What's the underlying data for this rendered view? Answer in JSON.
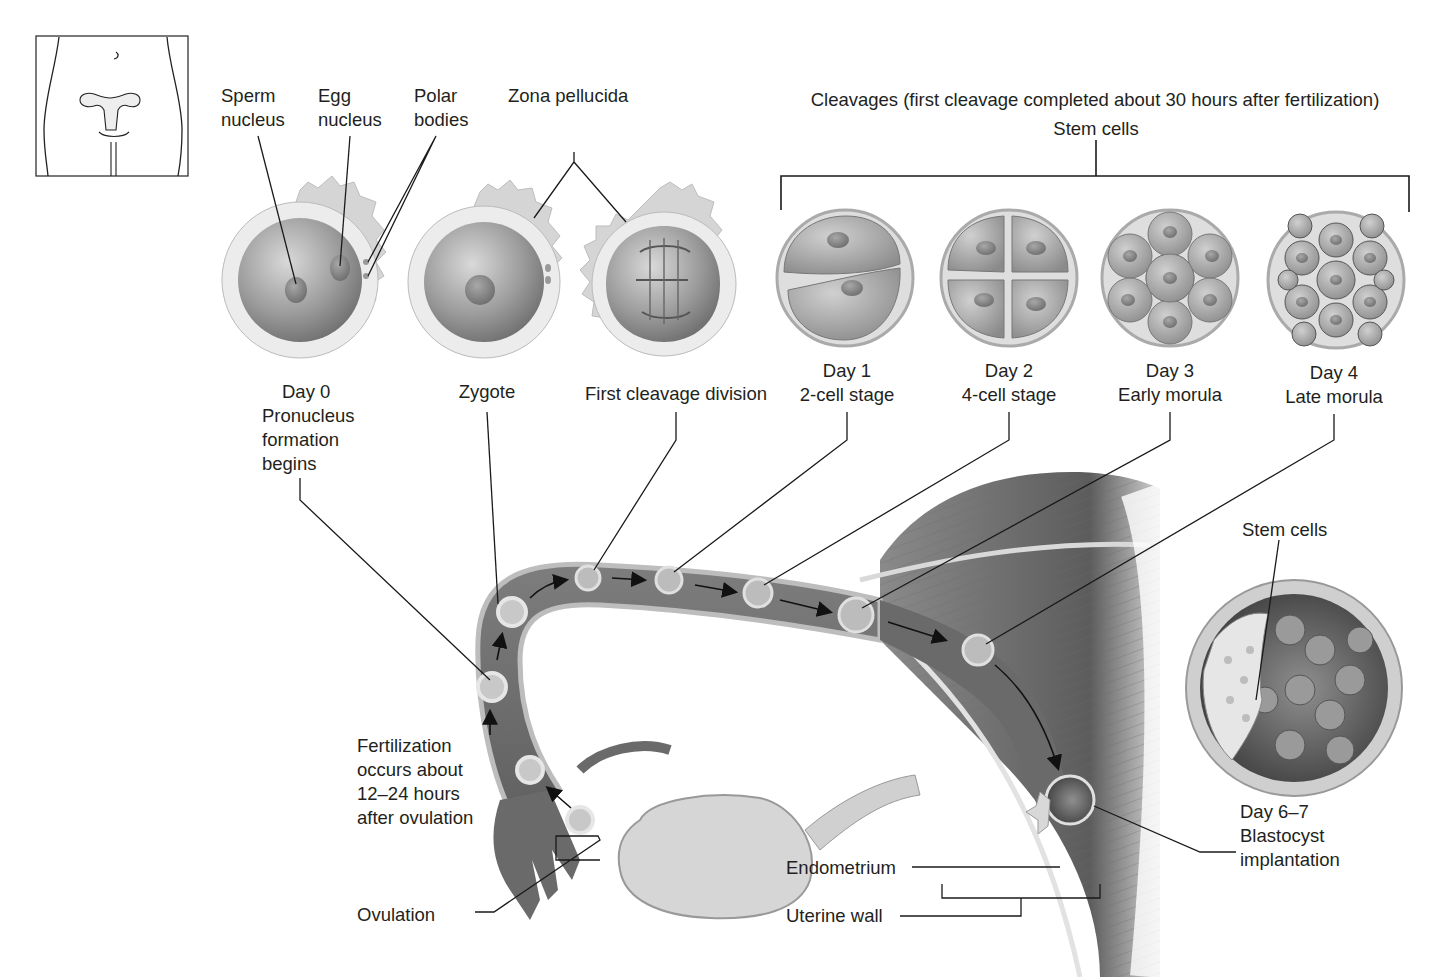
{
  "figure": {
    "type": "anatomical-diagram"
  },
  "locator_inset": {
    "name": "female-torso-with-uterus-locator"
  },
  "top_labels": {
    "sperm_nucleus": [
      "Sperm",
      "nucleus"
    ],
    "egg_nucleus": [
      "Egg",
      "nucleus"
    ],
    "polar_bodies": [
      "Polar",
      "bodies"
    ],
    "zona_pellucida": "Zona pellucida",
    "cleavages_title": "Cleavages (first cleavage completed about 30 hours after fertilization)",
    "stem_cells_top": "Stem cells"
  },
  "stages": [
    {
      "id": "day0",
      "lines": [
        "Day 0",
        "Pronucleus",
        "formation",
        "begins"
      ]
    },
    {
      "id": "zygote",
      "lines": [
        "Zygote"
      ]
    },
    {
      "id": "first-cleavage",
      "lines": [
        "First cleavage division"
      ]
    },
    {
      "id": "day1",
      "lines": [
        "Day 1",
        "2-cell stage"
      ]
    },
    {
      "id": "day2",
      "lines": [
        "Day 2",
        "4-cell stage"
      ]
    },
    {
      "id": "day3",
      "lines": [
        "Day 3",
        "Early morula"
      ]
    },
    {
      "id": "day4",
      "lines": [
        "Day 4",
        "Late morula"
      ]
    }
  ],
  "bottom_labels": {
    "fertilization": [
      "Fertilization",
      "occurs about",
      "12–24 hours",
      "after ovulation"
    ],
    "ovulation": "Ovulation",
    "endometrium": "Endometrium",
    "uterine_wall": "Uterine wall",
    "stem_cells_blastocyst": "Stem cells",
    "blastocyst": [
      "Day 6–7",
      "Blastocyst",
      "implantation"
    ]
  },
  "colors": {
    "background": "#ffffff",
    "text": "#231f20",
    "leader_line": "#1a1a1a",
    "tissue_dark": "#6f6f6f",
    "tissue_mid": "#9a9a9a",
    "tissue_light": "#cfcfcf",
    "cell_fill": "#b5b5b5",
    "zona": "#d8d8d8"
  }
}
